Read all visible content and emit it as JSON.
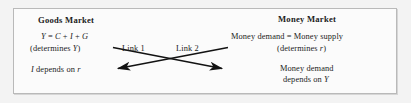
{
  "figure": {
    "frame_color": "#b9b9b9",
    "background_color": "#fbfbfb",
    "page_background": "#f3f3f3",
    "ink_color": "#1b1b1b"
  },
  "goods_market": {
    "title": "Goods Market",
    "equation": "Y = C + I + G",
    "equation_parts": {
      "y": "Y",
      "eq": " = ",
      "c": "C",
      "plus1": " + ",
      "i": "I",
      "plus2": " + ",
      "g": "G"
    },
    "determines": "(determines Y)",
    "determines_parts": {
      "pre": "(determines ",
      "var": "Y",
      "post": ")"
    },
    "investment": "I depends on r",
    "investment_parts": {
      "i": "I",
      "mid": " depends on ",
      "r": "r"
    }
  },
  "money_market": {
    "title": "Money Market",
    "equation": "Money demand = Money supply",
    "determines": "(determines r)",
    "determines_parts": {
      "pre": "(determines ",
      "var": "r",
      "post": ")"
    },
    "demand_line1": "Money demand",
    "demand_line2": "depends on Y",
    "demand_line2_parts": {
      "pre": "depends on ",
      "var": "Y"
    }
  },
  "links": [
    {
      "label": "Link 1",
      "direction": "goods-to-money",
      "arrowhead": "right-end-lower"
    },
    {
      "label": "Link 2",
      "direction": "money-to-goods",
      "arrowhead": "left-end-lower"
    }
  ]
}
